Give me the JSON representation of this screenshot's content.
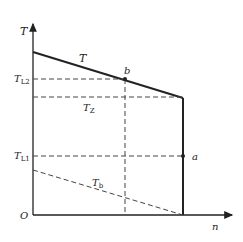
{
  "diagram": {
    "axes": {
      "y_label": "T",
      "x_label": "n",
      "origin_label": "O"
    },
    "curves": {
      "main": {
        "label": "T"
      },
      "z": {
        "label_main": "T",
        "label_sub": "Z"
      },
      "b": {
        "label_main": "T",
        "label_sub": "b"
      }
    },
    "levels": {
      "l2": {
        "label_main": "T",
        "label_sub": "L2"
      },
      "l1": {
        "label_main": "T",
        "label_sub": "L1"
      }
    },
    "points": {
      "a": "a",
      "b": "b"
    },
    "colors": {
      "line": "#222222",
      "dashed": "#444444"
    }
  }
}
